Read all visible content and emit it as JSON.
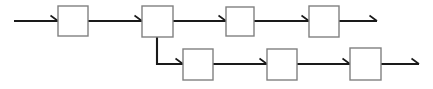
{
  "diagram": {
    "type": "flowchart",
    "orientation": "left-to-right",
    "title": "",
    "canvas": {
      "width": 433,
      "height": 89
    },
    "background_color": "#ffffff",
    "node_style": {
      "shape": "rectangle",
      "fill_color": "#ffffff",
      "border_color": "#808080",
      "border_width": 1.4,
      "label": ""
    },
    "connector_style": {
      "line_color": "#1a1a1a",
      "line_width": 2.1,
      "arrow_type": "open-barb",
      "routing": "orthogonal"
    },
    "rows": [
      {
        "name": "top-row",
        "node_count": 4,
        "y_center": 21
      },
      {
        "name": "bottom-row",
        "node_count": 3,
        "y_center": 64
      }
    ],
    "nodes": [
      {
        "id": "n1",
        "row": "top-row",
        "index": 0,
        "label": "",
        "x": 58,
        "y": 6,
        "w": 30,
        "h": 30
      },
      {
        "id": "n2",
        "row": "top-row",
        "index": 1,
        "label": "",
        "x": 142,
        "y": 6,
        "w": 31,
        "h": 31
      },
      {
        "id": "n3",
        "row": "top-row",
        "index": 2,
        "label": "",
        "x": 226,
        "y": 7,
        "w": 28,
        "h": 29
      },
      {
        "id": "n4",
        "row": "top-row",
        "index": 3,
        "label": "",
        "x": 309,
        "y": 6,
        "w": 30,
        "h": 31
      },
      {
        "id": "n5",
        "row": "bottom-row",
        "index": 0,
        "label": "",
        "x": 183,
        "y": 49,
        "w": 30,
        "h": 31
      },
      {
        "id": "n6",
        "row": "bottom-row",
        "index": 1,
        "label": "",
        "x": 267,
        "y": 49,
        "w": 30,
        "h": 31
      },
      {
        "id": "n7",
        "row": "bottom-row",
        "index": 2,
        "label": "",
        "x": 350,
        "y": 48,
        "w": 31,
        "h": 32
      }
    ],
    "edges": [
      {
        "id": "e0",
        "from": "input",
        "to": "n1",
        "kind": "straight",
        "arrow": true,
        "path": "M 14,21 L 58,21",
        "head_x": 58,
        "head_y": 21
      },
      {
        "id": "e1",
        "from": "n1",
        "to": "n2",
        "kind": "straight",
        "arrow": true,
        "path": "M 88,21 L 142,21",
        "head_x": 142,
        "head_y": 21
      },
      {
        "id": "e2",
        "from": "n2",
        "to": "n3",
        "kind": "straight",
        "arrow": true,
        "path": "M 173,21 L 226,21",
        "head_x": 226,
        "head_y": 21
      },
      {
        "id": "e3",
        "from": "n3",
        "to": "n4",
        "kind": "straight",
        "arrow": true,
        "path": "M 254,21 L 309,21",
        "head_x": 309,
        "head_y": 21
      },
      {
        "id": "e4",
        "from": "n4",
        "to": "output-top",
        "kind": "straight",
        "arrow": true,
        "path": "M 339,21 L 377,21",
        "head_x": 377,
        "head_y": 21
      },
      {
        "id": "e5",
        "from": "n2",
        "to": "n5",
        "kind": "elbow",
        "arrow": true,
        "path": "M 157,37 L 157,64 L 183,64",
        "head_x": 183,
        "head_y": 64
      },
      {
        "id": "e6",
        "from": "n5",
        "to": "n6",
        "kind": "straight",
        "arrow": true,
        "path": "M 213,64 L 267,64",
        "head_x": 267,
        "head_y": 64
      },
      {
        "id": "e7",
        "from": "n6",
        "to": "n7",
        "kind": "straight",
        "arrow": true,
        "path": "M 297,64 L 350,64",
        "head_x": 350,
        "head_y": 64
      },
      {
        "id": "e8",
        "from": "n7",
        "to": "output-bottom",
        "kind": "straight",
        "arrow": true,
        "path": "M 381,64 L 419,64",
        "head_x": 419,
        "head_y": 64
      }
    ]
  }
}
